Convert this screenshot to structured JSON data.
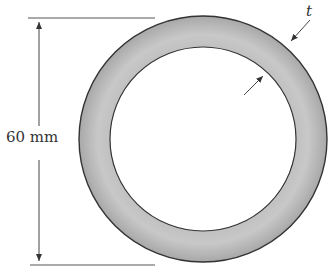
{
  "figure": {
    "type": "annular cross-section of tube",
    "diameter_label": "60 mm",
    "thickness_label": "t",
    "colors": {
      "ring_fill": "#a9a9a9",
      "ring_fill_light": "#d4d4d4",
      "outline": "#333333",
      "line": "#444444",
      "background": "#ffffff"
    }
  }
}
